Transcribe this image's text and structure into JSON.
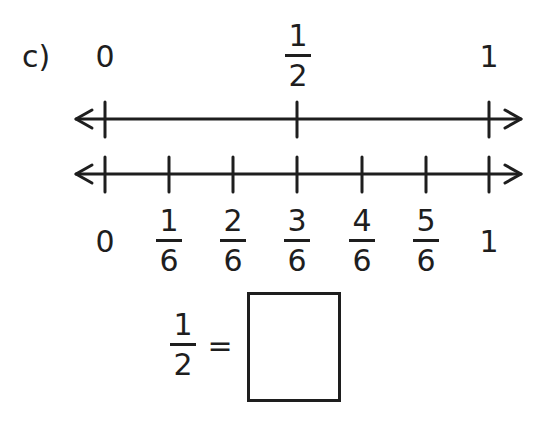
{
  "problem": {
    "label": "c)",
    "top_line": {
      "labels": {
        "start": "0",
        "end": "1",
        "mid": {
          "numerator": "1",
          "denominator": "2"
        }
      }
    },
    "bottom_line": {
      "start_label": "0",
      "end_label": "1",
      "fractions": [
        {
          "numerator": "1",
          "denominator": "6"
        },
        {
          "numerator": "2",
          "denominator": "6"
        },
        {
          "numerator": "3",
          "denominator": "6"
        },
        {
          "numerator": "4",
          "denominator": "6"
        },
        {
          "numerator": "5",
          "denominator": "6"
        }
      ]
    },
    "equation": {
      "left": {
        "numerator": "1",
        "denominator": "2"
      },
      "equals": "=",
      "answer": ""
    }
  },
  "colors": {
    "ink": "#1e1e1e",
    "background": "#ffffff"
  }
}
